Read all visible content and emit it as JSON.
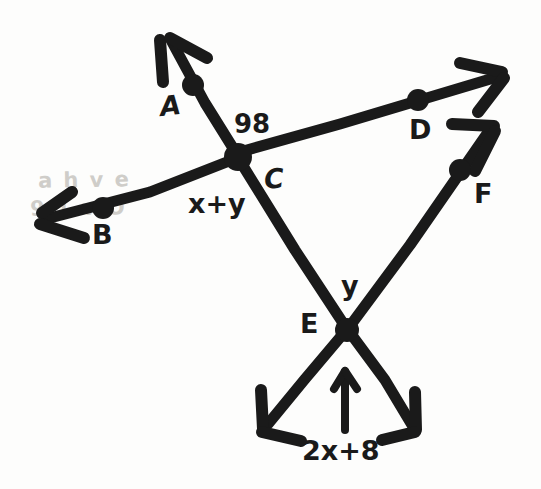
{
  "figure": {
    "kind": "hand-drawn-geometry-diagram",
    "ink_color": "#1a1a1a",
    "background_color": "#fdfdfc",
    "width": 541,
    "height": 489
  },
  "points": {
    "A": {
      "label": "A",
      "x": 193,
      "y": 85,
      "label_x": 160,
      "label_y": 92
    },
    "B": {
      "label": "B",
      "x": 103,
      "y": 208,
      "label_x": 92,
      "label_y": 221
    },
    "C": {
      "label": "C",
      "x": 238,
      "y": 155,
      "label_x": 264,
      "label_y": 165
    },
    "D": {
      "label": "D",
      "x": 418,
      "y": 100,
      "label_x": 409,
      "label_y": 116
    },
    "E": {
      "label": "E",
      "x": 347,
      "y": 330,
      "label_x": 300,
      "label_y": 310
    },
    "F": {
      "label": "F",
      "x": 460,
      "y": 170,
      "label_x": 474,
      "label_y": 180
    }
  },
  "angle_labels": [
    {
      "name": "angle-98",
      "text": "98",
      "x": 234,
      "y": 111
    },
    {
      "name": "angle-x-plus-y",
      "text": "x+y",
      "x": 188,
      "y": 190
    },
    {
      "name": "angle-y-at-e",
      "text": "y",
      "x": 341,
      "y": 272
    },
    {
      "name": "angle-2x-plus-8",
      "text": "2x+8",
      "x": 302,
      "y": 437
    }
  ],
  "arrow_tips": {
    "toward_A_beyond": {
      "x": 165,
      "y": 33
    },
    "beyond_B": {
      "x": 38,
      "y": 222
    },
    "beyond_D": {
      "x": 505,
      "y": 72
    },
    "beyond_F": {
      "x": 496,
      "y": 124
    },
    "lower_left_of_E": {
      "x": 262,
      "y": 430
    },
    "lower_right_of_E": {
      "x": 416,
      "y": 432
    }
  },
  "indicator_arrow": {
    "name": "angle-indicator-arrow",
    "from_x": 345,
    "from_y": 430,
    "to_x": 345,
    "to_y": 370
  },
  "rays": [
    {
      "name": "ray-C-through-A",
      "from": "C",
      "through": "A",
      "arrow": true
    },
    {
      "name": "ray-C-through-B",
      "from": "C",
      "through": "B",
      "arrow": true
    },
    {
      "name": "ray-C-through-D",
      "from": "C",
      "through": "D",
      "arrow": true
    },
    {
      "name": "ray-E-through-F",
      "from": "E",
      "through": "F",
      "arrow": true
    },
    {
      "name": "segment-C-to-E",
      "from": "C",
      "through": "E",
      "arrow": false
    },
    {
      "name": "ray-E-lower-left",
      "from": "E",
      "through": "lower-left",
      "arrow": true
    },
    {
      "name": "ray-E-lower-right",
      "from": "E",
      "through": "lower-right",
      "arrow": true
    }
  ],
  "artifact_text": {
    "name": "paper-show-through-smudge",
    "line1": "a h v e",
    "line2": "9 1 v O"
  }
}
